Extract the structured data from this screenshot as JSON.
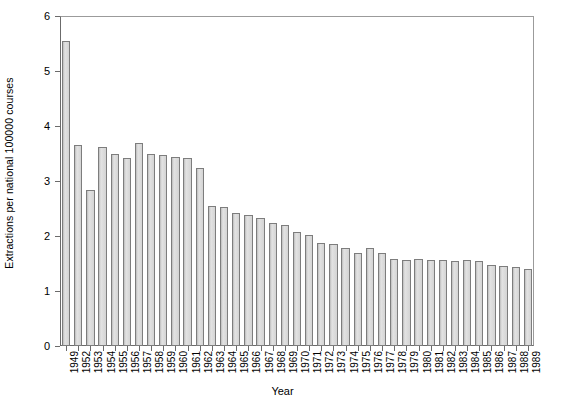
{
  "chart_data": {
    "type": "bar",
    "title": "",
    "xlabel": "Year",
    "ylabel": "Extractions per national 100000 courses",
    "ylim": [
      0,
      6
    ],
    "yticks": [
      0,
      1,
      2,
      3,
      4,
      5,
      6
    ],
    "ytick_labels": [
      "0",
      "1",
      "2",
      "3",
      "4",
      "5",
      "6"
    ],
    "grid": false,
    "legend": null,
    "bar_color": "#d2d2d2",
    "bar_edge_color": "#7d7d7d",
    "categories": [
      "1949",
      "1952",
      "1953",
      "1954",
      "1955",
      "1956",
      "1957",
      "1958",
      "1959",
      "1960",
      "1961",
      "1962",
      "1963",
      "1964",
      "1965",
      "1966",
      "1967",
      "1968",
      "1969",
      "1970",
      "1971",
      "1972",
      "1973",
      "1974",
      "1975",
      "1976",
      "1977",
      "1978",
      "1979",
      "1980",
      "1981",
      "1982",
      "1983",
      "1984",
      "1985",
      "1986",
      "1987",
      "1988",
      "1989"
    ],
    "values": [
      5.54,
      3.66,
      2.84,
      3.62,
      3.5,
      3.42,
      3.7,
      3.5,
      3.48,
      3.44,
      3.42,
      3.24,
      2.54,
      2.52,
      2.42,
      2.38,
      2.32,
      2.24,
      2.2,
      2.08,
      2.02,
      1.88,
      1.86,
      1.78,
      1.7,
      1.78,
      1.7,
      1.58,
      1.56,
      1.58,
      1.56,
      1.56,
      1.54,
      1.56,
      1.54,
      1.48,
      1.46,
      1.44,
      1.4
    ]
  }
}
